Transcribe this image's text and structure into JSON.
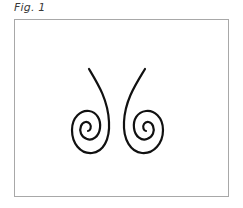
{
  "figure": {
    "caption": "Fig. 1",
    "stroke_color": "#111111",
    "frame_border_color": "#a8a8a8",
    "shapes": [
      {
        "name": "left-spiral",
        "direction": "descends from upper-left, curls counter-clockwise into spiral at bottom-left"
      },
      {
        "name": "right-spiral",
        "direction": "descends from upper-right, curls clockwise into spiral at bottom-right"
      }
    ]
  }
}
